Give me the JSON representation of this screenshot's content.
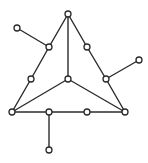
{
  "diagram": {
    "type": "graph",
    "width": 148,
    "height": 163,
    "colors": {
      "edge": "#2b2b2b",
      "node_fill": "#ffffff",
      "node_stroke": "#2b2b2b",
      "background": "#ffffff"
    },
    "node_radius": 3,
    "nodes": [
      {
        "id": "top",
        "x": 68,
        "y": 14
      },
      {
        "id": "bottom-left",
        "x": 12,
        "y": 112
      },
      {
        "id": "bottom-right",
        "x": 125,
        "y": 112
      },
      {
        "id": "center",
        "x": 68,
        "y": 79
      },
      {
        "id": "left-upper",
        "x": 49,
        "y": 47
      },
      {
        "id": "left-lower",
        "x": 31,
        "y": 79
      },
      {
        "id": "right-upper",
        "x": 87,
        "y": 47
      },
      {
        "id": "right-lower",
        "x": 106,
        "y": 79
      },
      {
        "id": "bottom-mid-left",
        "x": 49,
        "y": 112
      },
      {
        "id": "bottom-mid-right",
        "x": 87,
        "y": 112
      },
      {
        "id": "pendant-top-left",
        "x": 17,
        "y": 28
      },
      {
        "id": "pendant-right",
        "x": 139,
        "y": 60
      },
      {
        "id": "pendant-bottom",
        "x": 49,
        "y": 150
      }
    ],
    "edges": [
      {
        "from": "top",
        "to": "left-upper"
      },
      {
        "from": "left-upper",
        "to": "left-lower"
      },
      {
        "from": "left-lower",
        "to": "bottom-left"
      },
      {
        "from": "top",
        "to": "right-upper"
      },
      {
        "from": "right-upper",
        "to": "right-lower"
      },
      {
        "from": "right-lower",
        "to": "bottom-right"
      },
      {
        "from": "bottom-left",
        "to": "bottom-mid-left"
      },
      {
        "from": "bottom-mid-left",
        "to": "bottom-mid-right"
      },
      {
        "from": "bottom-mid-right",
        "to": "bottom-right"
      },
      {
        "from": "top",
        "to": "center"
      },
      {
        "from": "center",
        "to": "bottom-left"
      },
      {
        "from": "center",
        "to": "bottom-right"
      },
      {
        "from": "left-upper",
        "to": "pendant-top-left"
      },
      {
        "from": "right-lower",
        "to": "pendant-right"
      },
      {
        "from": "bottom-mid-left",
        "to": "pendant-bottom"
      }
    ]
  }
}
